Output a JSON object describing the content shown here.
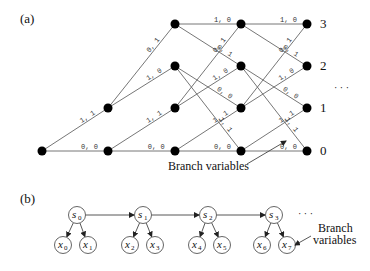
{
  "panel_a": {
    "label": "(a)",
    "state_labels": [
      "3",
      "2",
      "1",
      "0"
    ],
    "ellipsis": "· · ·",
    "annotation": "Branch variables",
    "columns_x": [
      42,
      108,
      175,
      241,
      307
    ],
    "rows_y": {
      "3": 24,
      "2": 66,
      "1": 108,
      "0": 151
    },
    "transitions": [
      {
        "from_col": 0,
        "from": 0,
        "to": 0,
        "label": "0, 0"
      },
      {
        "from_col": 0,
        "from": 0,
        "to": 1,
        "label": "1, 1"
      },
      {
        "from_col": 1,
        "from": 0,
        "to": 0,
        "label": "0, 0"
      },
      {
        "from_col": 1,
        "from": 0,
        "to": 1,
        "label": "1, 1"
      },
      {
        "from_col": 1,
        "from": 1,
        "to": 2,
        "label": "1, 0"
      },
      {
        "from_col": 1,
        "from": 1,
        "to": 3,
        "label": "0, 1"
      },
      {
        "from_col": 2,
        "from": 0,
        "to": 0,
        "label": "0, 0"
      },
      {
        "from_col": 2,
        "from": 0,
        "to": 1,
        "label": "1, 1"
      },
      {
        "from_col": 2,
        "from": 1,
        "to": 2,
        "label": "1, 0"
      },
      {
        "from_col": 2,
        "from": 1,
        "to": 3,
        "label": "0, 1"
      },
      {
        "from_col": 2,
        "from": 2,
        "to": 0,
        "label": "1, 1"
      },
      {
        "from_col": 2,
        "from": 2,
        "to": 1,
        "label": "0, 0"
      },
      {
        "from_col": 2,
        "from": 3,
        "to": 2,
        "label": "0, 1"
      },
      {
        "from_col": 2,
        "from": 3,
        "to": 3,
        "label": "1, 0"
      },
      {
        "from_col": 3,
        "from": 0,
        "to": 0,
        "label": "0, 0"
      },
      {
        "from_col": 3,
        "from": 0,
        "to": 1,
        "label": "1, 1"
      },
      {
        "from_col": 3,
        "from": 1,
        "to": 2,
        "label": "1, 0"
      },
      {
        "from_col": 3,
        "from": 1,
        "to": 3,
        "label": "0, 1"
      },
      {
        "from_col": 3,
        "from": 2,
        "to": 0,
        "label": "1, 1"
      },
      {
        "from_col": 3,
        "from": 2,
        "to": 1,
        "label": "0, 0"
      },
      {
        "from_col": 3,
        "from": 3,
        "to": 2,
        "label": "0, 1"
      },
      {
        "from_col": 3,
        "from": 3,
        "to": 3,
        "label": "1, 0"
      }
    ]
  },
  "panel_b": {
    "label": "(b)",
    "ellipsis": "· · ·",
    "annotation_line1": "Branch",
    "annotation_line2": "variables",
    "state_nodes": [
      {
        "name": "s",
        "sub": "0"
      },
      {
        "name": "s",
        "sub": "1"
      },
      {
        "name": "s",
        "sub": "2"
      },
      {
        "name": "s",
        "sub": "3"
      }
    ],
    "branch_nodes": [
      {
        "name": "x",
        "sub": "0"
      },
      {
        "name": "x",
        "sub": "1"
      },
      {
        "name": "x",
        "sub": "2"
      },
      {
        "name": "x",
        "sub": "3"
      },
      {
        "name": "x",
        "sub": "4"
      },
      {
        "name": "x",
        "sub": "5"
      },
      {
        "name": "x",
        "sub": "6"
      },
      {
        "name": "x",
        "sub": "7"
      }
    ]
  }
}
